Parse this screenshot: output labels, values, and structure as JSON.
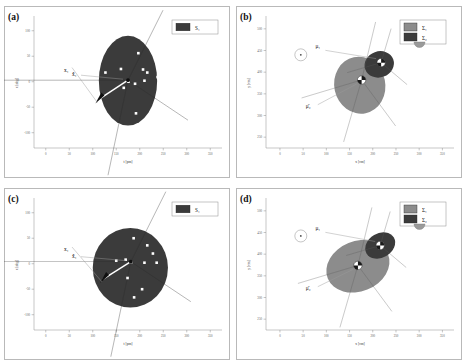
{
  "figure": {
    "width": 467,
    "height": 364,
    "background": "#ffffff",
    "panel_border_color": "#b9b9b9"
  },
  "colors": {
    "set_dark": "#3b3b3b",
    "sigma1_gray": "#8c8c8c",
    "sigma2_dark": "#3b3b3b",
    "marker_white": "#ffffff",
    "axis": "#8d8d8d",
    "text": "#111111",
    "leader_line": "#9a9a9a"
  },
  "panels": [
    {
      "tag": "(a)",
      "type": "set_scatter",
      "xlabel": "t [pm]",
      "ylabel": "x [deg]",
      "xticks": [
        0,
        50,
        100,
        150,
        200,
        250,
        300,
        350
      ],
      "yticks": [
        100,
        50,
        0,
        -50,
        -100
      ],
      "xlim": [
        -25,
        375
      ],
      "ylim": [
        -130,
        125
      ],
      "legend": [
        {
          "label": "S₁",
          "color": "#3b3b3b",
          "name": "legend-set-s1"
        }
      ],
      "vector_labels": [
        {
          "text": "x̂₁",
          "name": "estimate-label"
        },
        {
          "text": "x₁",
          "name": "truth-label"
        }
      ],
      "region": {
        "shape": "ellipse",
        "cx": 175,
        "cy": 2,
        "rx": 62,
        "ry": 88,
        "rotation": 0,
        "fill": "#3b3b3b"
      },
      "points": [
        {
          "x": 103,
          "y": 20
        },
        {
          "x": 127,
          "y": 18
        },
        {
          "x": 160,
          "y": 25
        },
        {
          "x": 197,
          "y": 56
        },
        {
          "x": 207,
          "y": 24
        },
        {
          "x": 216,
          "y": 18
        },
        {
          "x": 238,
          "y": 9
        },
        {
          "x": 210,
          "y": 2
        },
        {
          "x": 190,
          "y": -4
        },
        {
          "x": 166,
          "y": -12
        },
        {
          "x": 176,
          "y": 0
        },
        {
          "x": 192,
          "y": -62
        }
      ],
      "estimate": {
        "x": 175,
        "y": 3
      },
      "truth": {
        "x": 112,
        "y": -35
      }
    },
    {
      "tag": "(b)",
      "type": "gaussian_ellipses",
      "xlabel": "x [cm]",
      "ylabel": "y [cm]",
      "xticks": [
        0,
        50,
        100,
        150,
        200,
        250,
        300,
        350
      ],
      "yticks": [
        250,
        300,
        350,
        400,
        450,
        500
      ],
      "xlim": [
        -30,
        375
      ],
      "ylim": [
        225,
        525
      ],
      "legend": [
        {
          "label": "Σ₁",
          "color": "#8c8c8c",
          "name": "legend-sigma1"
        },
        {
          "label": "Σ₂",
          "color": "#3b3b3b",
          "name": "legend-sigma2"
        }
      ],
      "mean_labels": [
        {
          "text": "μ₁",
          "name": "mu1-label"
        },
        {
          "text": "μ̄₂",
          "name": "mu2-label"
        }
      ],
      "inset_marker": {
        "x": 45,
        "y": 440,
        "name": "reference-marker"
      },
      "ellipses": [
        {
          "name": "sigma1-ellipse",
          "cx": 172,
          "cy": 370,
          "rx": 55,
          "ry": 66,
          "rotation": -12,
          "fill": "#8c8c8c"
        },
        {
          "name": "sigma2-ellipse",
          "cx": 214,
          "cy": 418,
          "rx": 32,
          "ry": 30,
          "rotation": -20,
          "fill": "#3b3b3b"
        }
      ],
      "mean1": {
        "x": 218,
        "y": 422
      },
      "mean2": {
        "x": 176,
        "y": 382
      }
    },
    {
      "tag": "(c)",
      "type": "set_scatter",
      "xlabel": "t [pm]",
      "ylabel": "x [deg]",
      "xticks": [
        0,
        50,
        100,
        150,
        200,
        250,
        300,
        350
      ],
      "yticks": [
        100,
        50,
        0,
        -50,
        -100
      ],
      "xlim": [
        -25,
        375
      ],
      "ylim": [
        -130,
        125
      ],
      "legend": [
        {
          "label": "S₁",
          "color": "#3b3b3b",
          "name": "legend-set-s1"
        }
      ],
      "vector_labels": [
        {
          "text": "x̂₁",
          "name": "estimate-label"
        },
        {
          "text": "x₁",
          "name": "truth-label"
        }
      ],
      "region": {
        "shape": "circle",
        "cx": 180,
        "cy": -8,
        "rx": 80,
        "ry": 78,
        "rotation": 0,
        "fill": "#3b3b3b"
      },
      "points": [
        {
          "x": 187,
          "y": 50
        },
        {
          "x": 216,
          "y": 36
        },
        {
          "x": 228,
          "y": 20
        },
        {
          "x": 150,
          "y": 6
        },
        {
          "x": 170,
          "y": 8
        },
        {
          "x": 210,
          "y": 2
        },
        {
          "x": 236,
          "y": 2
        },
        {
          "x": 182,
          "y": 3
        },
        {
          "x": 174,
          "y": -28
        },
        {
          "x": 205,
          "y": -50
        },
        {
          "x": 188,
          "y": -66
        }
      ],
      "estimate": {
        "x": 181,
        "y": 4
      },
      "truth": {
        "x": 122,
        "y": -30
      }
    },
    {
      "tag": "(d)",
      "type": "gaussian_ellipses",
      "xlabel": "x [cm]",
      "ylabel": "y [cm]",
      "xticks": [
        0,
        50,
        100,
        150,
        200,
        250,
        300,
        350
      ],
      "yticks": [
        250,
        300,
        350,
        400,
        450,
        500
      ],
      "xlim": [
        -30,
        375
      ],
      "ylim": [
        225,
        525
      ],
      "legend": [
        {
          "label": "Σ₁",
          "color": "#8c8c8c",
          "name": "legend-sigma1"
        },
        {
          "label": "Σ₂",
          "color": "#3b3b3b",
          "name": "legend-sigma2"
        }
      ],
      "mean_labels": [
        {
          "text": "μ₁",
          "name": "mu1-label"
        },
        {
          "text": "μ̄₂",
          "name": "mu2-label"
        }
      ],
      "inset_marker": {
        "x": 45,
        "y": 442,
        "name": "reference-marker"
      },
      "ellipses": [
        {
          "name": "sigma1-ellipse",
          "cx": 168,
          "cy": 372,
          "rx": 70,
          "ry": 58,
          "rotation": -22,
          "fill": "#8c8c8c"
        },
        {
          "name": "sigma2-ellipse",
          "cx": 216,
          "cy": 420,
          "rx": 34,
          "ry": 28,
          "rotation": -30,
          "fill": "#3b3b3b"
        }
      ],
      "mean1": {
        "x": 216,
        "y": 420
      },
      "mean2": {
        "x": 168,
        "y": 374
      }
    }
  ],
  "chart_data": {
    "type": "scatter",
    "title": "",
    "panel_count": 4,
    "panel_tags": [
      "(a)",
      "(b)",
      "(c)",
      "(d)"
    ],
    "series": [
      {
        "name": "(a) S1 members",
        "panel": "(a)",
        "x": [
          103,
          127,
          160,
          197,
          207,
          216,
          238,
          210,
          190,
          166,
          176,
          192
        ],
        "y": [
          20,
          18,
          25,
          56,
          24,
          18,
          9,
          2,
          -4,
          -12,
          0,
          -62
        ]
      },
      {
        "name": "(c) S1 members",
        "panel": "(c)",
        "x": [
          187,
          216,
          228,
          150,
          170,
          210,
          236,
          182,
          174,
          205,
          188
        ],
        "y": [
          50,
          36,
          20,
          6,
          8,
          2,
          2,
          3,
          -28,
          -50,
          -66
        ]
      }
    ],
    "annotations": [
      {
        "panel": "(a)",
        "text": "x̂₁",
        "x": 175,
        "y": 3
      },
      {
        "panel": "(a)",
        "text": "x₁",
        "x": 112,
        "y": -35
      },
      {
        "panel": "(b)",
        "text": "μ₁",
        "x": 218,
        "y": 422
      },
      {
        "panel": "(b)",
        "text": "μ̄₂",
        "x": 176,
        "y": 382
      },
      {
        "panel": "(c)",
        "text": "x̂₁",
        "x": 181,
        "y": 4
      },
      {
        "panel": "(c)",
        "text": "x₁",
        "x": 122,
        "y": -30
      },
      {
        "panel": "(d)",
        "text": "μ₁",
        "x": 216,
        "y": 420
      },
      {
        "panel": "(d)",
        "text": "μ̄₂",
        "x": 168,
        "y": 374
      }
    ],
    "xlabel_top": "t [pm]",
    "ylabel_top": "x [deg]",
    "xlabel_right": "x [cm]",
    "ylabel_right": "y [cm]",
    "grid": false,
    "legend_position": "top-right"
  }
}
